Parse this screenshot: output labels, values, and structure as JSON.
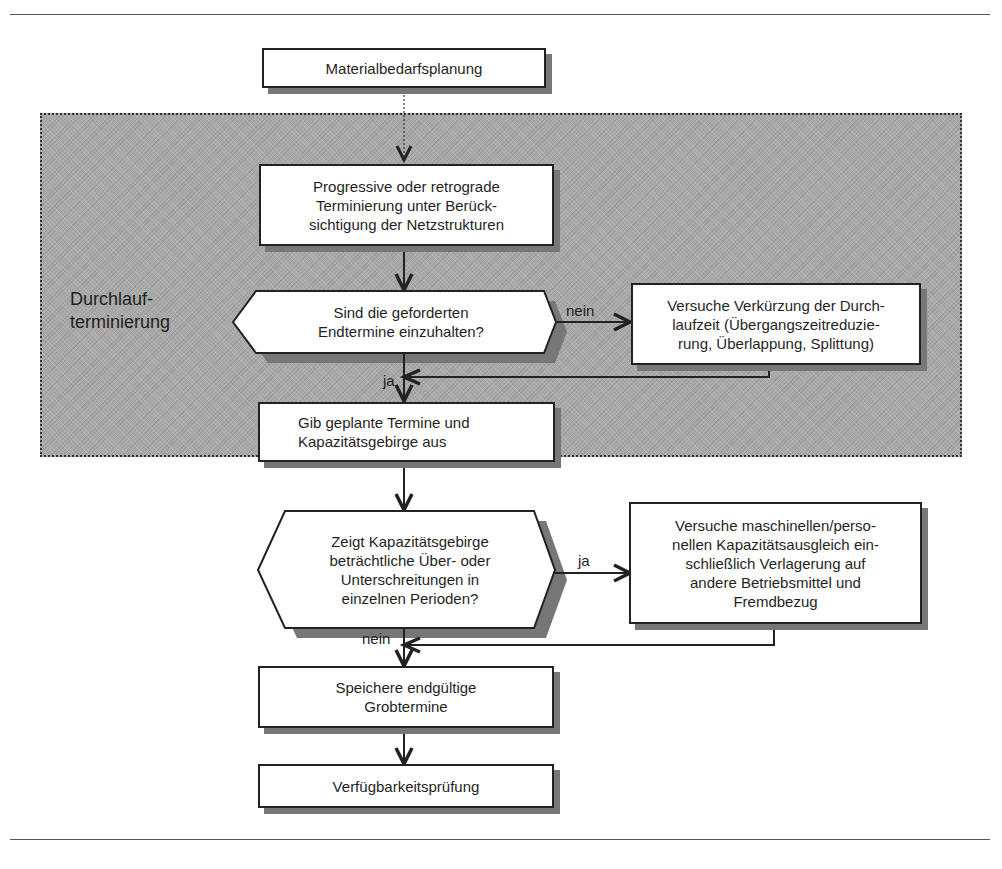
{
  "diagram": {
    "group": {
      "label": "Durchlauf-\nterminierung"
    },
    "nodes": {
      "materialbedarf": {
        "text": "Materialbedarfsplanung"
      },
      "terminierung": {
        "text": "Progressive oder retrograde\nTerminierung unter Berück-\nsichtigung der Netzstrukturen"
      },
      "decision1": {
        "text": "Sind die geforderten\nEndtermine einzuhalten?"
      },
      "verkuerzung": {
        "text": "Versuche Verkürzung der Durch-\nlaufzeit (Übergangszeitreduzie-\nrung, Überlappung, Splittung)"
      },
      "ausgabe": {
        "text": "Gib geplante Termine und\nKapazitätsgebirge aus"
      },
      "decision2": {
        "text": "Zeigt Kapazitätsgebirge\nbeträchtliche Über- oder\nUnterschreitungen in\neinzelnen Perioden?"
      },
      "ausgleich": {
        "text": "Versuche maschinellen/perso-\nnellen Kapazitätsausgleich ein-\nschließlich Verlagerung auf\nandere Betriebsmittel und\nFremdbezug"
      },
      "speichern": {
        "text": "Speichere endgültige\nGrobtermine"
      },
      "verfuegbarkeit": {
        "text": "Verfügbarkeitsprüfung"
      }
    },
    "edge_labels": {
      "d1_no": "nein",
      "d1_yes": "ja",
      "d2_yes": "ja",
      "d2_no": "nein"
    },
    "colors": {
      "group_fill": "#a9a9a9",
      "box_fill": "#ffffff",
      "stroke": "#222222",
      "shadow": "#777777"
    }
  }
}
